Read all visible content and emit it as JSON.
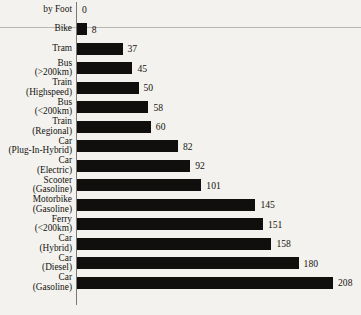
{
  "chart_data": {
    "type": "bar",
    "orientation": "horizontal",
    "title": "",
    "subtitle": "",
    "xlabel": "",
    "ylabel": "",
    "grid": false,
    "legend": false,
    "xlim": [
      0,
      208
    ],
    "value_labels_shown": true,
    "categories": [
      "by Foot",
      "Bike",
      "Tram",
      "Bus (>200km)",
      "Train (Highspeed)",
      "Bus (<200km)",
      "Train (Regional)",
      "Car (Plug-In-Hybrid)",
      "Car (Electric)",
      "Scooter (Gasoline)",
      "Motorbike (Gasoline)",
      "Ferry (<200km)",
      "Car (Hybrid)",
      "Car (Diesel)",
      "Car (Gasoline)"
    ],
    "values": [
      0,
      8,
      37,
      45,
      50,
      58,
      60,
      82,
      92,
      101,
      145,
      151,
      158,
      180,
      208
    ]
  },
  "rows": [
    {
      "line1": "by Foot",
      "line2": "",
      "value": 0,
      "value_text": "0"
    },
    {
      "line1": "Bike",
      "line2": "",
      "value": 8,
      "value_text": "8"
    },
    {
      "line1": "Tram",
      "line2": "",
      "value": 37,
      "value_text": "37"
    },
    {
      "line1": "Bus",
      "line2": "(>200km)",
      "value": 45,
      "value_text": "45"
    },
    {
      "line1": "Train",
      "line2": "(Highspeed)",
      "value": 50,
      "value_text": "50"
    },
    {
      "line1": "Bus",
      "line2": "(<200km)",
      "value": 58,
      "value_text": "58"
    },
    {
      "line1": "Train",
      "line2": "(Regional)",
      "value": 60,
      "value_text": "60"
    },
    {
      "line1": "Car",
      "line2": "(Plug-In-Hybrid)",
      "value": 82,
      "value_text": "82"
    },
    {
      "line1": "Car",
      "line2": "(Electric)",
      "value": 92,
      "value_text": "92"
    },
    {
      "line1": "Scooter",
      "line2": "(Gasoline)",
      "value": 101,
      "value_text": "101"
    },
    {
      "line1": "Motorbike",
      "line2": "(Gasoline)",
      "value": 145,
      "value_text": "145"
    },
    {
      "line1": "Ferry",
      "line2": "(<200km)",
      "value": 151,
      "value_text": "151"
    },
    {
      "line1": "Car",
      "line2": "(Hybrid)",
      "value": 158,
      "value_text": "158"
    },
    {
      "line1": "Car",
      "line2": "(Diesel)",
      "value": 180,
      "value_text": "180"
    },
    {
      "line1": "Car",
      "line2": "(Gasoline)",
      "value": 208,
      "value_text": "208"
    }
  ],
  "style": {
    "bar_color": "#100f0d",
    "background_color": "#f3f2ee",
    "axis_color": "#7a7873",
    "text_color": "#14120f",
    "rule_color": "#b9b7b2"
  },
  "layout": {
    "axis_x": 77,
    "row_pitch": 19.5,
    "first_row_top": 0,
    "px_per_unit": 1.231,
    "value_gap": 5
  }
}
